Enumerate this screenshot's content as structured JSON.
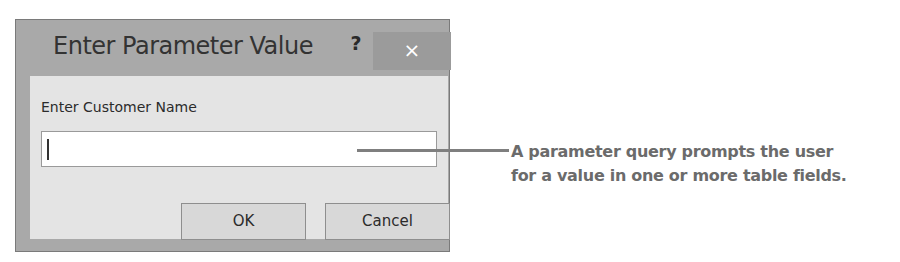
{
  "dialog": {
    "title": "Enter Parameter Value",
    "help_label": "?",
    "close_label": "×",
    "prompt_label": "Enter Customer Name",
    "input_value": "",
    "ok_label": "OK",
    "cancel_label": "Cancel"
  },
  "callout": {
    "line1": "A parameter query prompts the user",
    "line2": "for a value in one or more table fields."
  }
}
